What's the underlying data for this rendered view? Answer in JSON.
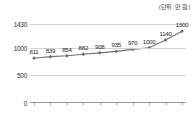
{
  "unit_caption": "(단위: 만 원)",
  "chart_data": {
    "type": "line",
    "title": "",
    "subtitle": "",
    "xlabel": "",
    "ylabel": "",
    "unit_note": "(단위: 만 원)",
    "categories": [
      "2011",
      "2012",
      "2013",
      "2014",
      "2015",
      "2016",
      "2017",
      "2018",
      "2019",
      "2020"
    ],
    "values": [
      811,
      839,
      854,
      882,
      908,
      935,
      970,
      1000,
      1140,
      1300
    ],
    "point_labels": [
      "811",
      "839",
      "854",
      "882",
      "908",
      "935",
      "970",
      "1000",
      "1140",
      "1300"
    ],
    "ytick_labels": [
      "0",
      "500",
      "1000",
      "1430"
    ],
    "ytick_values": [
      0,
      500,
      1000,
      1430
    ],
    "ylim": [
      0,
      1430
    ],
    "grid": true,
    "grid_axis": "y",
    "legend": false,
    "legend_position": "none",
    "series_color": "#6f6f7a",
    "marker": "diamond",
    "marker_color": "#6f6f7a",
    "grid_color": "#d2d2d2",
    "axis_color": "#9a9a9a",
    "text_color": "#2b2b2b",
    "background": "#ffffff"
  }
}
